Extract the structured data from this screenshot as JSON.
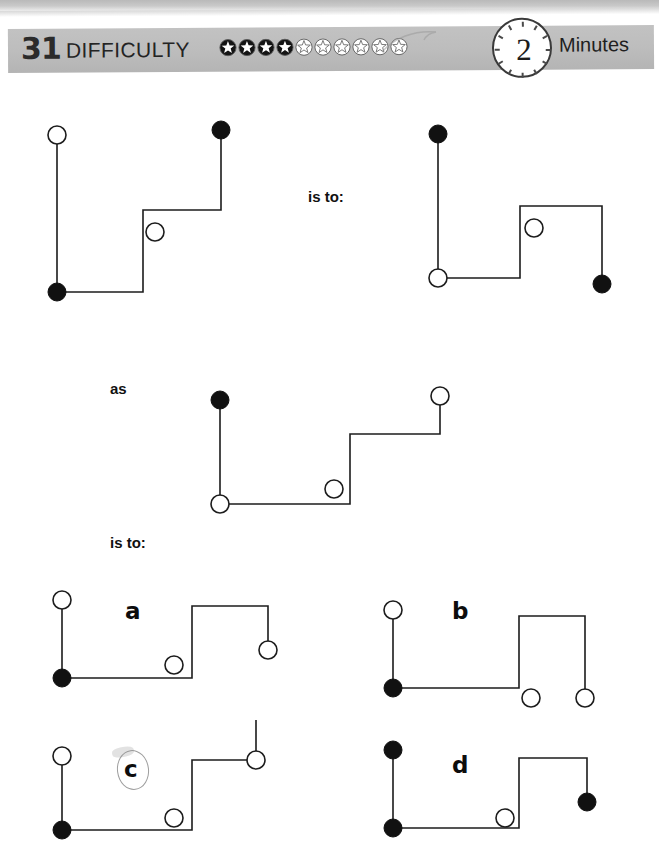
{
  "header": {
    "puzzle_number": "31",
    "difficulty_label": "DIFFICULTY",
    "stars_filled": 4,
    "stars_total": 10,
    "timer_value": "2",
    "timer_unit": "Minutes"
  },
  "relations": {
    "is_to_1": "is to:",
    "as": "as",
    "is_to_2": "is to:"
  },
  "options": {
    "a": "a",
    "b": "b",
    "c": "c",
    "d": "d",
    "marked": "c"
  },
  "colors": {
    "band": "#bdbdbd",
    "ink": "#1c1c1c",
    "node_fill": "#111111",
    "node_open": "#ffffff",
    "pencil": "#8d8d8d"
  },
  "figures": {
    "q1_left": {
      "name": "question-1-left-figure",
      "path": "M 22,25 L 22,182 L 108,182 L 108,100 L 186,100 L 186,20",
      "nodes": [
        {
          "x": 22,
          "y": 25,
          "type": "open"
        },
        {
          "x": 22,
          "y": 182,
          "type": "filled"
        },
        {
          "x": 120,
          "y": 122,
          "type": "open"
        },
        {
          "x": 186,
          "y": 20,
          "type": "filled"
        }
      ]
    },
    "q1_right": {
      "name": "question-1-right-figure",
      "path": "M 20,22 L 20,166 L 102,166 L 102,94 L 184,94 L 184,172",
      "nodes": [
        {
          "x": 20,
          "y": 22,
          "type": "filled"
        },
        {
          "x": 20,
          "y": 166,
          "type": "open"
        },
        {
          "x": 116,
          "y": 116,
          "type": "open"
        },
        {
          "x": 184,
          "y": 172,
          "type": "filled"
        }
      ]
    },
    "q2_left": {
      "name": "question-2-figure",
      "path": "M 22,22 L 22,126 L 152,126 L 152,56 L 242,56 L 242,18",
      "nodes": [
        {
          "x": 22,
          "y": 22,
          "type": "filled"
        },
        {
          "x": 22,
          "y": 126,
          "type": "open"
        },
        {
          "x": 136,
          "y": 111,
          "type": "open"
        },
        {
          "x": 242,
          "y": 18,
          "type": "open"
        }
      ]
    },
    "opt_a": {
      "name": "option-a-figure",
      "path": "M 22,22 L 22,100 L 152,100 L 152,28 L 228,28 L 228,72",
      "nodes": [
        {
          "x": 22,
          "y": 22,
          "type": "open"
        },
        {
          "x": 22,
          "y": 100,
          "type": "filled"
        },
        {
          "x": 134,
          "y": 87,
          "type": "open"
        },
        {
          "x": 228,
          "y": 72,
          "type": "open"
        }
      ]
    },
    "opt_b": {
      "name": "option-b-figure",
      "path": "M 22,22 L 22,100 L 148,100 L 148,28 L 214,28 L 214,104",
      "nodes": [
        {
          "x": 22,
          "y": 22,
          "type": "open"
        },
        {
          "x": 22,
          "y": 100,
          "type": "filled"
        },
        {
          "x": 160,
          "y": 110,
          "type": "open"
        },
        {
          "x": 214,
          "y": 110,
          "type": "open"
        }
      ]
    },
    "opt_c": {
      "name": "option-c-figure",
      "path": "M 22,38 L 22,112 L 152,112 L 152,42 L 216,42 L 216,2",
      "nodes": [
        {
          "x": 22,
          "y": 38,
          "type": "open"
        },
        {
          "x": 22,
          "y": 112,
          "type": "filled"
        },
        {
          "x": 134,
          "y": 100,
          "type": "open"
        },
        {
          "x": 216,
          "y": 42,
          "type": "open"
        }
      ]
    },
    "opt_d": {
      "name": "option-d-figure",
      "path": "M 22,22 L 22,100 L 148,100 L 148,30 L 216,30 L 216,74",
      "nodes": [
        {
          "x": 22,
          "y": 22,
          "type": "filled"
        },
        {
          "x": 22,
          "y": 100,
          "type": "filled"
        },
        {
          "x": 134,
          "y": 90,
          "type": "open"
        },
        {
          "x": 216,
          "y": 74,
          "type": "filled"
        }
      ]
    }
  }
}
